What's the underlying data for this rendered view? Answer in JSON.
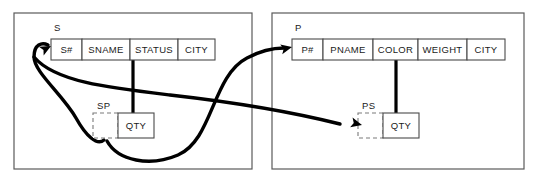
{
  "diagram": {
    "colors": {
      "panel_border": "#5a5a5a",
      "cell_border": "#4a4a4a",
      "dashed_border": "#7a7a7a",
      "link": "#000000",
      "background": "#ffffff",
      "text": "#1a1a1a"
    },
    "panels": [
      {
        "name": "left-panel",
        "x": 14,
        "y": 13,
        "width": 238,
        "height": 156
      },
      {
        "name": "right-panel",
        "x": 272,
        "y": 13,
        "width": 252,
        "height": 156
      }
    ],
    "tables": [
      {
        "id": "S",
        "label": "S",
        "label_x": 54,
        "label_y": 28,
        "x": 51,
        "y": 39,
        "height": 21,
        "columns": [
          {
            "label": "S#",
            "width": 31
          },
          {
            "label": "SNAME",
            "width": 48
          },
          {
            "label": "STATUS",
            "width": 48
          },
          {
            "label": "CITY",
            "width": 37
          }
        ]
      },
      {
        "id": "SP",
        "label": "SP",
        "label_x": 97,
        "label_y": 106,
        "x": 93,
        "y": 113,
        "height": 25,
        "columns": [
          {
            "label": "",
            "width": 25,
            "dashed": true
          },
          {
            "label": "QTY",
            "width": 36,
            "dashed": false
          }
        ]
      },
      {
        "id": "P",
        "label": "P",
        "label_x": 295,
        "label_y": 28,
        "x": 292,
        "y": 39,
        "height": 21,
        "columns": [
          {
            "label": "P#",
            "width": 31
          },
          {
            "label": "PNAME",
            "width": 50
          },
          {
            "label": "COLOR",
            "width": 45
          },
          {
            "label": "WEIGHT",
            "width": 49
          },
          {
            "label": "CITY",
            "width": 38
          }
        ]
      },
      {
        "id": "PS",
        "label": "PS",
        "label_x": 362,
        "label_y": 106,
        "x": 358,
        "y": 113,
        "height": 25,
        "columns": [
          {
            "label": "",
            "width": 25,
            "dashed": true
          },
          {
            "label": "QTY",
            "width": 36,
            "dashed": false
          }
        ]
      }
    ],
    "connectors": [
      {
        "name": "status-to-sp-qty",
        "type": "straight-vertical",
        "from": "S.STATUS",
        "to": "SP.QTY",
        "path": "M 133 60 L 133 113"
      },
      {
        "name": "color-to-ps-qty",
        "type": "straight-vertical",
        "from": "P.COLOR",
        "to": "PS.QTY",
        "path": "M 396 60 L 396 113"
      },
      {
        "name": "sp-to-s-foreign-key",
        "type": "curve-arrow",
        "from": "SP.key",
        "to": "S.S#",
        "path": "M 104 140 C 97 146 86 136 76 118 C 63 95 34 72 34 57 C 34 44 42 42 48 45"
      },
      {
        "name": "sp-to-p-foreign-key",
        "type": "curve-arrow",
        "from": "SP.key",
        "to": "P.P#",
        "path": "M 107 141 C 118 161 150 167 178 155 C 213 140 212 76 247 58 C 262 50 275 48 284 48"
      },
      {
        "name": "s-to-ps-foreign-key",
        "type": "curve-arrow",
        "from": "S.S#",
        "to": "PS.key",
        "path": "M 34 57 C 55 82 110 88 170 95 C 250 104 300 114 340 124"
      }
    ],
    "arrowheads": [
      {
        "name": "arrow-into-s-key",
        "x": 51,
        "y": 46,
        "angle": -28
      },
      {
        "name": "arrow-into-p-key",
        "x": 292,
        "y": 47,
        "angle": -12
      },
      {
        "name": "arrow-into-ps-key",
        "x": 362,
        "y": 125,
        "angle": 14
      }
    ]
  }
}
